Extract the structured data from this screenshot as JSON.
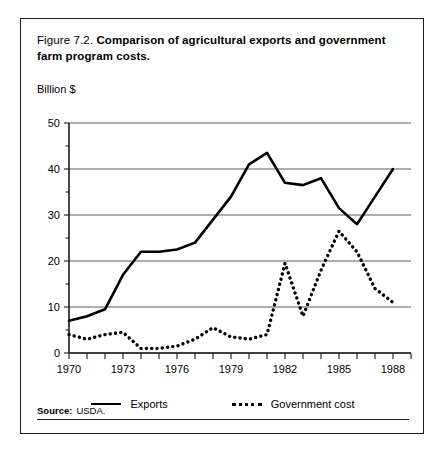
{
  "figure": {
    "number": "Figure 7.2.",
    "title": "Comparison of agricultural exports and government farm program costs.",
    "unit_label": "Billion $",
    "source_label": "Source:",
    "source_value": "USDA."
  },
  "legend": {
    "exports_label": "Exports",
    "government_label": "Government cost"
  },
  "chart_data": {
    "type": "line",
    "title": "Comparison of agricultural exports and government farm program costs.",
    "xlabel": "",
    "ylabel": "Billion $",
    "xlim": [
      1970,
      1989
    ],
    "ylim": [
      0,
      50
    ],
    "grid": true,
    "legend_position": "bottom",
    "y_ticks": [
      0,
      10,
      20,
      30,
      40,
      50
    ],
    "y_tick_labels": [
      "0",
      "10",
      "20",
      "30",
      "40",
      "50"
    ],
    "x_ticks": [
      1970,
      1971,
      1972,
      1973,
      1974,
      1975,
      1976,
      1977,
      1978,
      1979,
      1980,
      1981,
      1982,
      1983,
      1984,
      1985,
      1986,
      1987,
      1988,
      1989
    ],
    "x_tick_labels": [
      "1970",
      "",
      "",
      "1973",
      "",
      "",
      "1976",
      "",
      "",
      "1979",
      "",
      "",
      "1982",
      "",
      "",
      "1985",
      "",
      "",
      "1988",
      ""
    ],
    "x": [
      1970,
      1971,
      1972,
      1973,
      1974,
      1975,
      1976,
      1977,
      1978,
      1979,
      1980,
      1981,
      1982,
      1983,
      1984,
      1985,
      1986,
      1987,
      1988
    ],
    "series": [
      {
        "name": "Exports",
        "style": "solid",
        "color": "#000000",
        "values": [
          7,
          8,
          9.5,
          17,
          22,
          22,
          22.5,
          24,
          29,
          34,
          41,
          43.5,
          37,
          36.5,
          38,
          31.5,
          28,
          34,
          40
        ]
      },
      {
        "name": "Government cost",
        "style": "dotted",
        "color": "#000000",
        "values": [
          4,
          3,
          4,
          4.5,
          1,
          1,
          1.5,
          3,
          5.5,
          3.5,
          3,
          4,
          19.5,
          8,
          18,
          26.5,
          22,
          14,
          11
        ]
      }
    ]
  }
}
